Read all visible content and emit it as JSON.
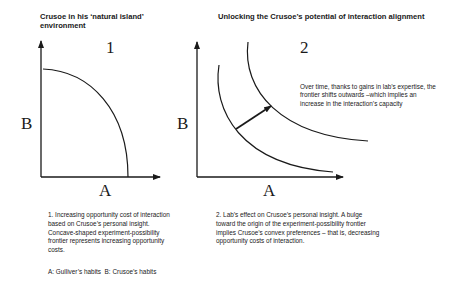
{
  "panel1": {
    "title": "Crusoe in his ‘natural island’ environment",
    "number": "1",
    "y_axis_label": "B",
    "x_axis_label": "A",
    "caption": "1. Increasing opportunity cost of interaction based on Crusoe’s personal insight. Concave-shaped experiment-possibility frontier represents increasing opportunity costs.",
    "legend": "A: Gulliver’s habits  B: Crusoe’s habits"
  },
  "panel2": {
    "title": "Unlocking the Crusoe’s potential of interaction alignment",
    "number": "2",
    "y_axis_label": "B",
    "x_axis_label": "A",
    "annotation": "Over time, thanks to gains in lab’s expertise, the frontier shifts outwards –which implies an increase in the interaction’s capacity",
    "caption": "2. Lab’s effect on Crusoe’s personal insight. A bulge toward the origin of the experiment-possibility frontier implies Crusoe’s convex preferences – that is, decreasing opportunity costs of interaction."
  },
  "colors": {
    "ink": "#1a1a1a",
    "background": "#ffffff"
  }
}
